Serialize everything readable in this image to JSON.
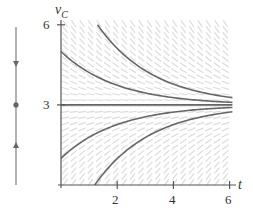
{
  "chart_data": {
    "type": "line",
    "title": "",
    "xlabel": "t",
    "ylabel": "v_C",
    "ylabel_main": "v",
    "ylabel_sub": "C",
    "xlim": [
      0,
      6.2
    ],
    "ylim": [
      0,
      6.1
    ],
    "x_ticks": [
      2,
      4,
      6
    ],
    "x_tick_labels": [
      "2",
      "4",
      "6"
    ],
    "y_ticks": [
      3,
      6
    ],
    "y_tick_labels": [
      "3",
      "6"
    ],
    "grid": false,
    "slope_field": true,
    "ode": "dv/dt = (3 - v)/2",
    "equilibrium": 3,
    "time_constant": 2,
    "series": [
      {
        "name": "top-curve",
        "A": 5.75,
        "t_start": 1.3,
        "points": [
          [
            1.3,
            6.0
          ],
          [
            2,
            5.12
          ],
          [
            3,
            4.28
          ],
          [
            4,
            3.78
          ],
          [
            5,
            3.47
          ],
          [
            6,
            3.29
          ]
        ]
      },
      {
        "name": "v0-5",
        "A": 2.0,
        "t_start": 0,
        "points": [
          [
            0,
            5.0
          ],
          [
            1,
            4.21
          ],
          [
            2,
            3.74
          ],
          [
            3,
            3.45
          ],
          [
            4,
            3.27
          ],
          [
            5,
            3.16
          ],
          [
            6,
            3.1
          ]
        ]
      },
      {
        "name": "equilibrium-3",
        "A": 0.0,
        "t_start": 0,
        "points": [
          [
            0,
            3.0
          ],
          [
            6,
            3.0
          ]
        ]
      },
      {
        "name": "v0-1",
        "A": -2.0,
        "t_start": 0,
        "points": [
          [
            0,
            1.0
          ],
          [
            1,
            1.79
          ],
          [
            2,
            2.26
          ],
          [
            3,
            2.55
          ],
          [
            4,
            2.73
          ],
          [
            5,
            2.84
          ],
          [
            6,
            2.9
          ]
        ]
      },
      {
        "name": "bottom-curve",
        "A": -5.47,
        "t_start": 1.2,
        "points": [
          [
            1.2,
            0.0
          ],
          [
            2,
            0.99
          ],
          [
            3,
            1.78
          ],
          [
            4,
            2.26
          ],
          [
            5,
            2.55
          ],
          [
            6,
            2.73
          ]
        ]
      }
    ],
    "phase_line": {
      "equilibrium_value": 3,
      "above_arrow": "down",
      "below_arrow": "up"
    },
    "colors": {
      "curve": "#666666",
      "axis": "#555555",
      "slope": "#dcdcdc",
      "phase_line": "#888888"
    }
  }
}
